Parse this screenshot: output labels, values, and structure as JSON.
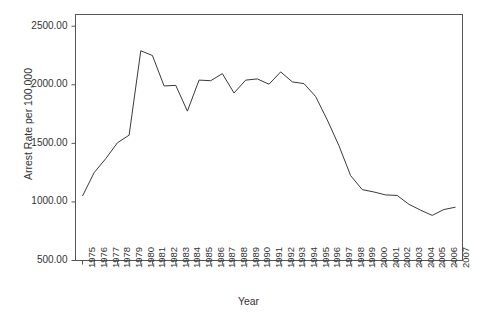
{
  "chart_data": {
    "type": "line",
    "title": "",
    "xlabel": "Year",
    "ylabel": "Arrest Rate per 100,000",
    "xlim": [
      1974.4,
      2007.6
    ],
    "ylim": [
      500,
      2600
    ],
    "grid": false,
    "legend": "none",
    "line_color": "#3a3a3a",
    "ytick_labels": [
      "2500.00",
      "2000.00",
      "1500.00",
      "1000.00",
      "500.00"
    ],
    "ytick_values": [
      2500,
      2000,
      1500,
      1000,
      500
    ],
    "categories": [
      "1975",
      "1976",
      "1977",
      "1978",
      "1979",
      "1980",
      "1981",
      "1982",
      "1983",
      "1984",
      "1985",
      "1986",
      "1987",
      "1988",
      "1989",
      "1990",
      "1991",
      "1992",
      "1993",
      "1994",
      "1995",
      "1996",
      "1997",
      "1998",
      "1999",
      "2000",
      "2001",
      "2002",
      "2003",
      "2004",
      "2005",
      "2006",
      "2007"
    ],
    "x": [
      1975,
      1976,
      1977,
      1978,
      1979,
      1980,
      1981,
      1982,
      1983,
      1984,
      1985,
      1986,
      1987,
      1988,
      1989,
      1990,
      1991,
      1992,
      1993,
      1994,
      1995,
      1996,
      1997,
      1998,
      1999,
      2000,
      2001,
      2002,
      2003,
      2004,
      2005,
      2006,
      2007
    ],
    "values": [
      1050,
      1250,
      1370,
      1505,
      1570,
      2290,
      2250,
      1990,
      1995,
      1775,
      2040,
      2035,
      2095,
      1930,
      2040,
      2050,
      2005,
      2110,
      2025,
      2010,
      1900,
      1700,
      1480,
      1225,
      1105,
      1085,
      1060,
      1055,
      980,
      930,
      885,
      935,
      955
    ]
  }
}
